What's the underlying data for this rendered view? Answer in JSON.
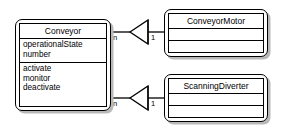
{
  "diagram": {
    "type": "uml-class-diagram",
    "background_color": "#ffffff",
    "line_color": "#000000",
    "shadow_color": "#b9b9b9",
    "classes": [
      {
        "id": "conveyor",
        "name": "Conveyor",
        "attributes": [
          "operationalState",
          "number"
        ],
        "operations": [
          "activate",
          "monitor",
          "deactivate"
        ]
      },
      {
        "id": "conveyor-motor",
        "name": "ConveyorMotor",
        "attributes": [],
        "operations": []
      },
      {
        "id": "scanning-diverter",
        "name": "ScanningDiverter",
        "attributes": [],
        "operations": []
      }
    ],
    "relationships": [
      {
        "id": "conveyor-to-conveyor-motor",
        "from": "conveyor",
        "to": "conveyor-motor",
        "source_multiplicity": "n",
        "target_multiplicity": "1",
        "arrowhead": "hollow-triangle"
      },
      {
        "id": "conveyor-to-scanning-diverter",
        "from": "conveyor",
        "to": "scanning-diverter",
        "source_multiplicity": "n",
        "target_multiplicity": "1",
        "arrowhead": "hollow-triangle"
      }
    ]
  }
}
